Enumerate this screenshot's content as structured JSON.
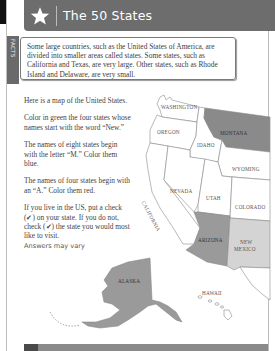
{
  "header": {
    "title": "The 50 States",
    "icon": "star-icon"
  },
  "facts_tab": {
    "label": "FACTS"
  },
  "facts_box": {
    "text": "Some large countries, such as the United States of America, are divided into smaller areas called states. Some states, such as California and Texas, are very large. Other states, such as Rhode Island and Delaware, are very small."
  },
  "instructions": {
    "intro": "Here is a map of the United States.",
    "green": "Color in green the four states whose names start with the word “New.”",
    "blue": "The names of eight states begin with the letter “M.” Color them blue.",
    "red": "The names of four states begin with an “A.” Color them red.",
    "check": "If you live in the US, put a check (✔) on your state. If you do not, check (✔) the state you would most like to visit.",
    "answers": "Answers may vary"
  },
  "map": {
    "states": [
      {
        "name": "WASHINGTON",
        "fill": "#ffffff"
      },
      {
        "name": "OREGON",
        "fill": "#ffffff"
      },
      {
        "name": "IDAHO",
        "fill": "#ffffff"
      },
      {
        "name": "MONTANA",
        "fill": "#8a8a8a"
      },
      {
        "name": "WYOMING",
        "fill": "#ffffff"
      },
      {
        "name": "NEVADA",
        "fill": "#ffffff"
      },
      {
        "name": "UTAH",
        "fill": "#ffffff"
      },
      {
        "name": "COLORADO",
        "fill": "#ffffff"
      },
      {
        "name": "CALIFORNIA",
        "fill": "#ffffff"
      },
      {
        "name": "ARIZONA",
        "fill": "#9a9a9a"
      },
      {
        "name": "NEW MEXICO",
        "fill": "#d4d4d4"
      },
      {
        "name": "ALASKA",
        "fill": "#9a9a9a"
      },
      {
        "name": "HAWAII",
        "fill": "#ffffff"
      }
    ],
    "labels": {
      "washington": "WASHINGTON",
      "oregon": "OREGON",
      "idaho": "IDAHO",
      "montana": "MONTANA",
      "wyoming": "WYOMING",
      "nevada": "NEVADA",
      "utah": "UTAH",
      "colorado": "COLORADO",
      "california": "CALIFORNIA",
      "arizona": "ARIZONA",
      "new_mexico_1": "NEW",
      "new_mexico_2": "MEXICO",
      "alaska": "ALASKA",
      "hawaii": "HAWAII"
    }
  },
  "colors": {
    "header_bg": "#6d6d6d",
    "montana": "#8a8a8a",
    "arizona": "#9a9a9a",
    "new_mexico": "#d4d4d4",
    "alaska": "#9a9a9a"
  }
}
